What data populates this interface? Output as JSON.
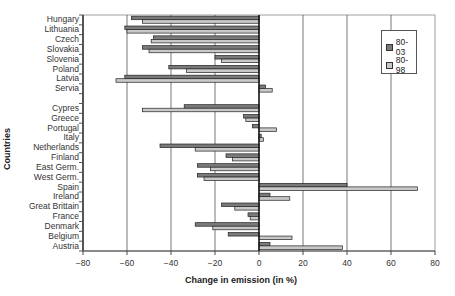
{
  "chart_data": {
    "type": "bar",
    "orientation": "horizontal",
    "title": "",
    "xlabel": "Change in emission (in %)",
    "ylabel": "Countries",
    "xlim": [
      -80,
      80
    ],
    "x_ticks": [
      -80,
      -60,
      -40,
      -20,
      0,
      20,
      40,
      60,
      80
    ],
    "x_tick_labels": [
      "−80",
      "−60",
      "−40",
      "−20",
      "0",
      "20",
      "40",
      "60",
      "80"
    ],
    "grid": "vertical major gridlines",
    "legend_position": "top-right inside plot",
    "categories": [
      "Hungary",
      "Lithuania",
      "Czech",
      "Slovakia",
      "Slovenia",
      "Poland",
      "Latvia",
      "Servia",
      "",
      "Cypres",
      "Greece",
      "Portugal",
      "Italy",
      "Netherlands",
      "Finland",
      "East Germ.",
      "West Germ.",
      "Spain",
      "Ireland",
      "Great Brittain",
      "France",
      "Denmark",
      "Belgium",
      "Austria"
    ],
    "series": [
      {
        "name": "80-03",
        "color": "#7a7a7a",
        "values": [
          -58,
          -61,
          -48,
          -53,
          -20,
          -41,
          -61,
          3,
          null,
          -34,
          -7,
          -3,
          1,
          -45,
          -15,
          -28,
          -28,
          40,
          5,
          -17,
          -5,
          -29,
          -14,
          5
        ]
      },
      {
        "name": "80-98",
        "color": "#c8c8c8",
        "values": [
          -53,
          -60,
          -49,
          -50,
          -17,
          -33,
          -65,
          6,
          null,
          -53,
          -6,
          8,
          2,
          -29,
          -12,
          -22,
          -25,
          72,
          14,
          -11,
          -4,
          -21,
          15,
          38
        ]
      }
    ]
  },
  "legend": {
    "items": [
      {
        "label": "80-03",
        "color": "#7a7a7a"
      },
      {
        "label": "80-98",
        "color": "#c8c8c8"
      }
    ]
  },
  "axes": {
    "x_title": "Change in emission (in %)",
    "y_title": "Countries"
  }
}
